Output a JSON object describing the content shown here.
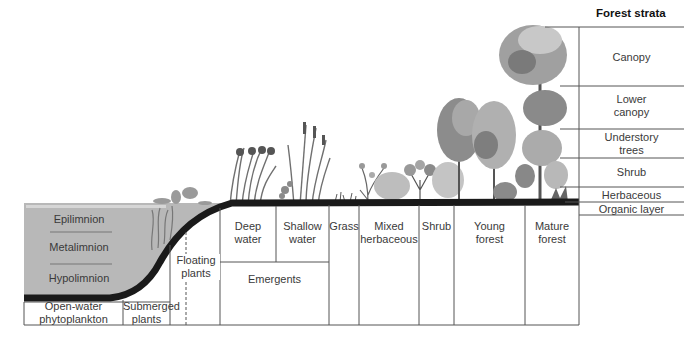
{
  "strata": {
    "title": "Forest strata",
    "layers": [
      {
        "label": "Canopy"
      },
      {
        "label": "Lower\ncanopy"
      },
      {
        "label": "Understory\ntrees"
      },
      {
        "label": "Shrub"
      },
      {
        "label": "Herbaceous"
      },
      {
        "label": "Organic layer"
      }
    ]
  },
  "lake_layers": [
    {
      "label": "Epilimnion"
    },
    {
      "label": "Metalimnion"
    },
    {
      "label": "Hypolimnion"
    }
  ],
  "zones": [
    {
      "label": "Open-water\nphytoplankton"
    },
    {
      "label": "Submerged\nplants"
    },
    {
      "label": "Floating\nplants"
    },
    {
      "label": "Deep\nwater"
    },
    {
      "label": "Shallow\nwater"
    },
    {
      "label": "Emergents"
    },
    {
      "label": "Grass"
    },
    {
      "label": "Mixed\nherbaceous"
    },
    {
      "label": "Shrub"
    },
    {
      "label": "Young\nforest"
    },
    {
      "label": "Mature\nforest"
    }
  ],
  "colors": {
    "water": "#b8b8b8",
    "soil": "#1a1a1a",
    "line": "#555555",
    "veg_dark": "#6e6e6e",
    "veg_mid": "#9a9a9a",
    "veg_light": "#c4c4c4"
  }
}
